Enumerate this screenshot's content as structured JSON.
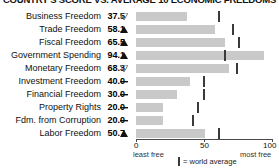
{
  "title": "COUNTRY'S SCORE VS. AVERAGE 10 ECONOMIC FREEDOMS",
  "axis": {
    "min_label": "0",
    "mid_label": "50",
    "max_label": "100",
    "min_sub": "least free",
    "max_sub": "most free"
  },
  "legend": {
    "swatch_name": "world-average-tick",
    "text": "= world average"
  },
  "chart_data": {
    "type": "bar",
    "title": "COUNTRY'S SCORE VS. AVERAGE 10 ECONOMIC FREEDOMS",
    "xlabel": "",
    "ylabel": "",
    "xlim": [
      0,
      100
    ],
    "grid": false,
    "legend_position": "bottom",
    "orientation": "horizontal",
    "categories": [
      "Business Freedom",
      "Trade Freedom",
      "Fiscal Freedom",
      "Government Spending",
      "Monetary Freedom",
      "Investment Freedom",
      "Financial Freedom",
      "Property Rights",
      "Fdm. from Corruption",
      "Labor Freedom"
    ],
    "values": [
      37.5,
      58.1,
      65.5,
      94.1,
      68.3,
      40.0,
      30.0,
      20.0,
      20.0,
      50.7
    ],
    "value_labels": [
      "37.5",
      "58.1",
      "65.5",
      "94.1",
      "68.3",
      "40.0",
      "30.0",
      "20.0",
      "20.0",
      "50.7"
    ],
    "trend_markers": [
      "down-open",
      "up-filled",
      "up-filled",
      "up-filled",
      "down-open",
      "dash",
      "dash",
      "dash",
      "dash",
      "up-filled"
    ],
    "world_average": [
      60.0,
      70.5,
      75.0,
      64.5,
      73.5,
      49.0,
      49.0,
      45.0,
      41.0,
      60.0
    ],
    "series": [
      {
        "name": "country score",
        "values": [
          37.5,
          58.1,
          65.5,
          94.1,
          68.3,
          40.0,
          30.0,
          20.0,
          20.0,
          50.7
        ]
      },
      {
        "name": "world average",
        "values": [
          60.0,
          70.5,
          75.0,
          64.5,
          73.5,
          49.0,
          49.0,
          45.0,
          41.0,
          60.0
        ]
      }
    ]
  },
  "rows": [
    {
      "label": "Business Freedom",
      "value": "37.5",
      "marker": "down-open",
      "bar": 37.5,
      "avg": 60.0
    },
    {
      "label": "Trade Freedom",
      "value": "58.1",
      "marker": "up-filled",
      "bar": 58.1,
      "avg": 70.5
    },
    {
      "label": "Fiscal Freedom",
      "value": "65.5",
      "marker": "up-filled",
      "bar": 65.5,
      "avg": 75.0
    },
    {
      "label": "Government Spending",
      "value": "94.1",
      "marker": "up-filled",
      "bar": 94.1,
      "avg": 64.5
    },
    {
      "label": "Monetary Freedom",
      "value": "68.3",
      "marker": "down-open",
      "bar": 68.3,
      "avg": 73.5
    },
    {
      "label": "Investment Freedom",
      "value": "40.0",
      "marker": "dash",
      "bar": 40.0,
      "avg": 49.0
    },
    {
      "label": "Financial Freedom",
      "value": "30.0",
      "marker": "dash",
      "bar": 30.0,
      "avg": 49.0
    },
    {
      "label": "Property Rights",
      "value": "20.0",
      "marker": "dash",
      "bar": 20.0,
      "avg": 45.0
    },
    {
      "label": "Fdm. from Corruption",
      "value": "20.0",
      "marker": "dash",
      "bar": 20.0,
      "avg": 41.0
    },
    {
      "label": "Labor Freedom",
      "value": "50.7",
      "marker": "up-filled",
      "bar": 50.7,
      "avg": 60.0
    }
  ],
  "colors": {
    "bar": "#c9c9c9",
    "tick": "#3a3a3a",
    "axis": "#4a4a4a",
    "text": "#111111"
  }
}
